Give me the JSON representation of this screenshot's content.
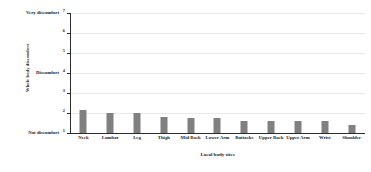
{
  "chart_data": {
    "type": "bar",
    "title": "",
    "xlabel": "Local body sites",
    "ylabel": "Whole body discomfort",
    "categories": [
      "Neck",
      "Lumbar",
      "Leg",
      "Thigh",
      "Mid Back",
      "Lower Arm",
      "Buttocks",
      "Upper Back",
      "Upper Arm",
      "Wrist",
      "Shoulder"
    ],
    "values": [
      2.15,
      2.0,
      2.0,
      1.8,
      1.75,
      1.75,
      1.6,
      1.6,
      1.6,
      1.6,
      1.4
    ],
    "ylim": [
      1,
      7
    ],
    "yticks": [
      1,
      2,
      3,
      4,
      5,
      6,
      7
    ],
    "ytick_labels": [
      "1",
      "2",
      "3",
      "4",
      "5",
      "6",
      "7"
    ],
    "ytick_named": {
      "1": "Not discomfort",
      "4": "Discomfort",
      "7": "Very discomfort"
    },
    "grid": true,
    "legend": false,
    "bar_color": "#808080",
    "axis_color": "#2b2b2b",
    "grid_color": "#e9e9e9",
    "background": "#ffffff"
  }
}
